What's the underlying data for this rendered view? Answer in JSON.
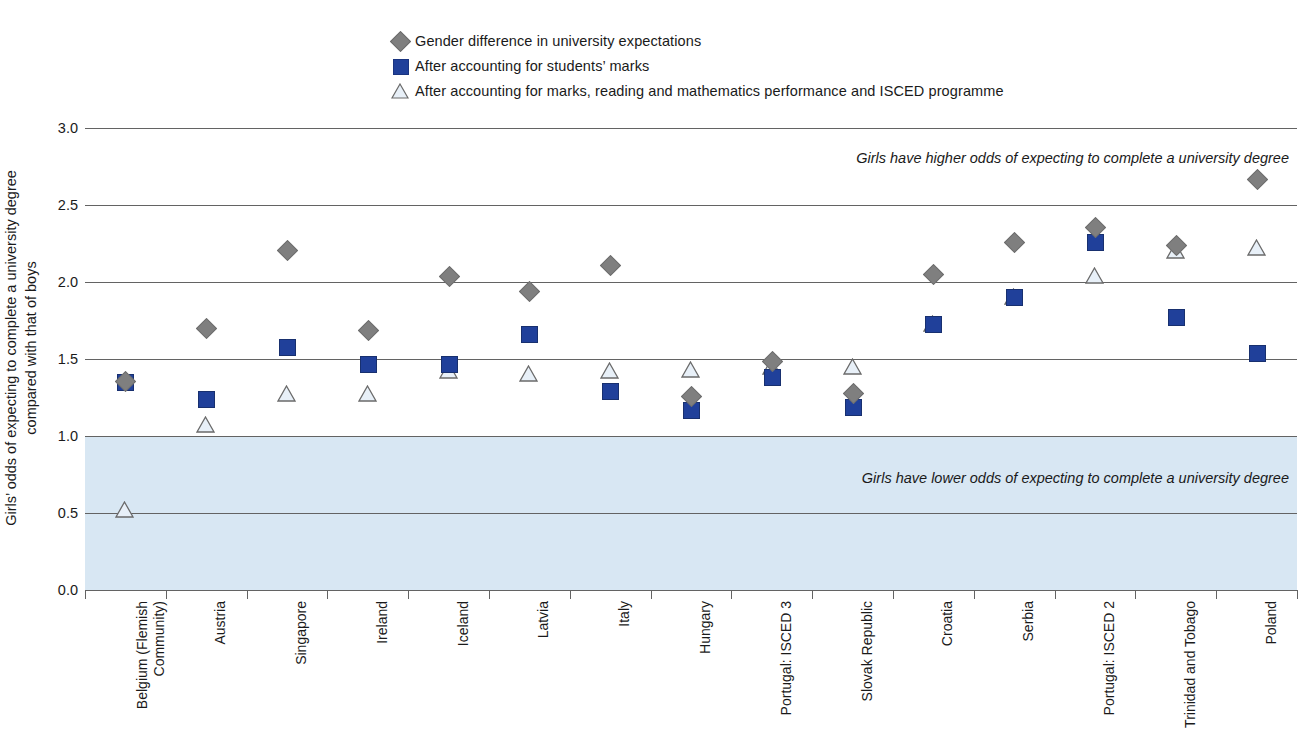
{
  "legend": {
    "items": [
      {
        "icon": "diamond-marker-icon",
        "label": "Gender difference in university expectations"
      },
      {
        "icon": "square-marker-icon",
        "label": "After accounting for students’ marks"
      },
      {
        "icon": "triangle-marker-icon",
        "label": "After accounting for marks, reading and mathematics performance and ISCED programme"
      }
    ]
  },
  "colors": {
    "diamond": "#7f7f7f",
    "square": "#20409a",
    "triangle_fill": "#e8f0f8",
    "triangle_stroke": "#6a6a6a",
    "shaded_band": "#d8e7f3",
    "gridline": "#636363"
  },
  "annotations": {
    "upper": "Girls have higher odds of expecting to complete a university degree",
    "lower": "Girls have lower odds of expecting to complete a university degree"
  },
  "axis": {
    "y_title_line1": "Girls’ odds of expecting to complete a university degree",
    "y_title_line2": "compared with that of boys",
    "y_ticks": [
      "3.0",
      "2.5",
      "2.0",
      "1.5",
      "1.0",
      "0.5",
      "0.0"
    ]
  },
  "chart_data": {
    "type": "scatter",
    "title": "",
    "xlabel": "",
    "ylabel": "Girls’ odds of expecting to complete a university degree compared with that of boys",
    "ylim": [
      0.0,
      3.0
    ],
    "ytick_values": [
      3.0,
      2.5,
      2.0,
      1.5,
      1.0,
      0.5,
      0.0
    ],
    "grid": true,
    "legend_position": "top-center",
    "reference_band": {
      "from": 0.0,
      "to": 1.0,
      "label": "Girls have lower odds of expecting to complete a university degree"
    },
    "categories": [
      "Belgium (Flemish Community)",
      "Austria",
      "Singapore",
      "Ireland",
      "Iceland",
      "Latvia",
      "Italy",
      "Hungary",
      "Portugal: ISCED 3",
      "Slovak Republic",
      "Croatia",
      "Serbia",
      "Portugal: ISCED 2",
      "Trinidad and Tobago",
      "Poland"
    ],
    "series": [
      {
        "name": "Gender difference in university expectations",
        "marker": "diamond",
        "color": "#7f7f7f",
        "values": [
          1.36,
          1.7,
          2.21,
          1.69,
          2.04,
          1.94,
          2.11,
          1.26,
          1.49,
          1.28,
          2.05,
          2.26,
          2.36,
          2.24,
          2.67
        ]
      },
      {
        "name": "After accounting for students’ marks",
        "marker": "square",
        "color": "#20409a",
        "values": [
          1.35,
          1.24,
          1.58,
          1.47,
          1.47,
          1.66,
          1.29,
          1.17,
          1.38,
          1.19,
          1.73,
          1.9,
          2.26,
          1.77,
          1.54
        ]
      },
      {
        "name": "After accounting for marks, reading and mathematics performance and ISCED programme",
        "marker": "triangle",
        "color": "#e8f0f8",
        "values": [
          0.52,
          1.07,
          1.27,
          1.27,
          1.42,
          1.4,
          1.42,
          1.43,
          1.45,
          1.45,
          1.73,
          1.9,
          2.04,
          2.2,
          2.22
        ]
      }
    ]
  }
}
